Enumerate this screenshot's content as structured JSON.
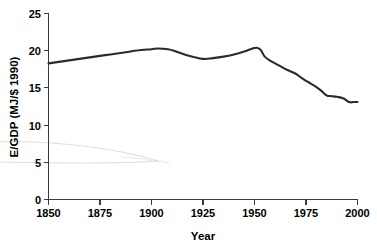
{
  "chart_data": {
    "type": "line",
    "title": "",
    "subtitle": "",
    "xlabel": "Year",
    "ylabel": "E/GDP (MJ/$ 1990)",
    "xlim": [
      1850,
      2000
    ],
    "ylim": [
      0,
      25
    ],
    "xticks": [
      1850,
      1875,
      1900,
      1925,
      1950,
      1975,
      2000
    ],
    "xtick_labels": [
      "1850",
      "1875",
      "1900",
      "1925",
      "1950",
      "1975",
      "2000"
    ],
    "yticks": [
      0,
      5,
      10,
      15,
      20,
      25
    ],
    "ytick_labels": [
      "0",
      "5",
      "10",
      "15",
      "20",
      "25"
    ],
    "grid": false,
    "legend": null,
    "legend_position": "none",
    "line_color": "#2b2b2b",
    "series": [
      {
        "name": "E/GDP",
        "x": [
          1850,
          1855,
          1860,
          1865,
          1870,
          1875,
          1880,
          1885,
          1890,
          1895,
          1900,
          1903,
          1908,
          1912,
          1916,
          1920,
          1925,
          1930,
          1935,
          1940,
          1945,
          1948,
          1951,
          1953,
          1955,
          1958,
          1962,
          1966,
          1970,
          1973,
          1976,
          1979,
          1982,
          1985,
          1987,
          1990,
          1993,
          1996,
          1998,
          2000
        ],
        "values": [
          18.3,
          18.5,
          18.7,
          18.9,
          19.1,
          19.3,
          19.5,
          19.7,
          19.9,
          20.1,
          20.2,
          20.3,
          20.2,
          19.9,
          19.5,
          19.2,
          18.9,
          19.0,
          19.2,
          19.5,
          19.9,
          20.2,
          20.4,
          20.1,
          19.2,
          18.6,
          18.0,
          17.4,
          16.9,
          16.3,
          15.8,
          15.3,
          14.7,
          14.0,
          13.9,
          13.8,
          13.6,
          13.1,
          13.1,
          13.1
        ]
      }
    ],
    "annotations": [
      {
        "name": "faint-lens-artifact",
        "description": "very faint light-gray lens / leaf shaped outline in lower-left plot area",
        "x_range": [
          1840,
          1903
        ],
        "y_range": [
          4.9,
          7.6
        ]
      }
    ]
  }
}
